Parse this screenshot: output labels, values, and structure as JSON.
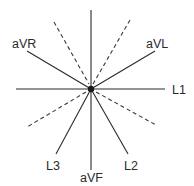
{
  "diagram": {
    "type": "hexaxial-reference-system",
    "leads": [
      {
        "id": "L1",
        "label": "L1",
        "angle_deg": 0
      },
      {
        "id": "L2",
        "label": "L2",
        "angle_deg": 60
      },
      {
        "id": "L3",
        "label": "L3",
        "angle_deg": 120
      },
      {
        "id": "aVR",
        "label": "aVR",
        "angle_deg": -150
      },
      {
        "id": "aVL",
        "label": "aVL",
        "angle_deg": -30
      },
      {
        "id": "aVF",
        "label": "aVF",
        "angle_deg": 90
      }
    ],
    "dashed_axes_angles_deg": [
      -120,
      -60,
      150,
      30
    ],
    "colors": {
      "line": "#2a2a2a",
      "background": "#ffffff"
    }
  }
}
